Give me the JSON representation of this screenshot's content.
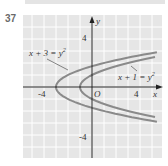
{
  "exercise_number": "37",
  "chart_data": {
    "type": "line",
    "title": "",
    "xlabel": "x",
    "ylabel": "y",
    "xlim": [
      -5.75,
      5.8
    ],
    "ylim": [
      -5.9,
      6
    ],
    "grid": true,
    "x_tick_labels": [
      "-4",
      "O",
      "4"
    ],
    "y_tick_labels": [
      "4",
      "-4"
    ],
    "origin_label": "O",
    "series": [
      {
        "name": "x + 3 = y²",
        "equation": "x = y^2 - 3",
        "vertex": [
          -3,
          0
        ],
        "y_range": [
          -2.9,
          2.9
        ]
      },
      {
        "name": "x + 1 = y²",
        "equation": "x = y^2 - 1",
        "vertex": [
          -1,
          0
        ],
        "y_range": [
          -2.5,
          2.5
        ]
      }
    ],
    "annotations": [
      {
        "text": "x + 3 = y",
        "sup": "2",
        "points_to": "outer curve"
      },
      {
        "text": "x + 1 = y",
        "sup": "2",
        "points_to": "inner curve"
      }
    ],
    "colors": {
      "background": "#e6e6e6",
      "grid": "#ffffff",
      "curve": "#808080",
      "axis": "#222222"
    }
  }
}
